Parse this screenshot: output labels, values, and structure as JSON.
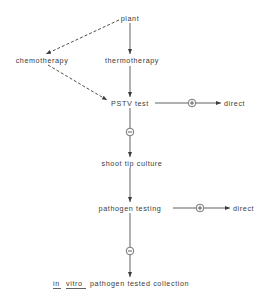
{
  "diagram": {
    "nodes": {
      "plant": "plant",
      "chemotherapy": "chemotherapy",
      "thermotherapy": "thermotherapy",
      "pstv_test": "PSTV test",
      "pstv_direct": "direct",
      "shoot_tip_culture": "shoot tip culture",
      "pathogen_testing": "pathogen testing",
      "pathogen_direct": "direct",
      "collection_in": "in",
      "collection_vitro": "vitro",
      "collection_rest": "pathogen tested collection"
    },
    "symbols": {
      "positive": "+",
      "negative": "−"
    },
    "edges": [
      {
        "from": "plant",
        "to": "chemotherapy",
        "style": "dashed"
      },
      {
        "from": "plant",
        "to": "thermotherapy",
        "style": "solid"
      },
      {
        "from": "chemotherapy",
        "to": "PSTV test",
        "style": "dashed"
      },
      {
        "from": "thermotherapy",
        "to": "PSTV test",
        "style": "solid"
      },
      {
        "from": "PSTV test",
        "to": "direct",
        "label": "+"
      },
      {
        "from": "PSTV test",
        "to": "shoot tip culture",
        "label": "−"
      },
      {
        "from": "shoot tip culture",
        "to": "pathogen testing",
        "style": "solid"
      },
      {
        "from": "pathogen testing",
        "to": "direct",
        "label": "+"
      },
      {
        "from": "pathogen testing",
        "to": "in vitro pathogen tested collection",
        "label": "−"
      }
    ]
  }
}
